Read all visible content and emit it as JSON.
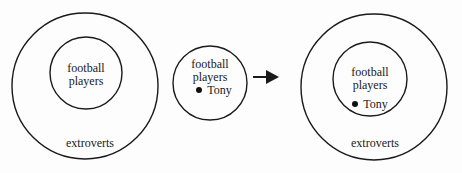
{
  "diagram": {
    "left": {
      "outer_label": "extroverts",
      "inner_label_1": "football",
      "inner_label_2": "players"
    },
    "middle": {
      "label_1": "football",
      "label_2": "players",
      "member": "Tony"
    },
    "arrow": "right-arrow",
    "right": {
      "outer_label": "extroverts",
      "inner_label_1": "football",
      "inner_label_2": "players",
      "member": "Tony"
    },
    "colors": {
      "stroke": "#1a1a1a",
      "background": "#fdfdfd"
    }
  }
}
